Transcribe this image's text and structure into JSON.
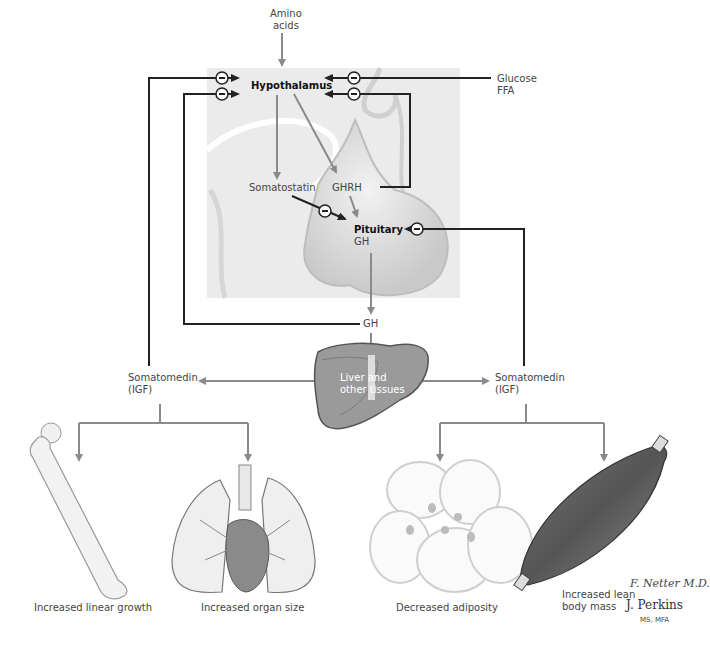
{
  "diagram": {
    "nodes": {
      "amino_acids": "Amino\nacids",
      "hypothalamus": "Hypothalamus",
      "glucose_ffa": "Glucose\nFFA",
      "somatostatin": "Somatostatin",
      "ghrh": "GHRH",
      "pituitary": "Pituitary",
      "pituitary_gh": "GH",
      "gh": "GH",
      "liver": "Liver and\nother tissues",
      "somatomedin_left": "Somatomedin\n(IGF)",
      "somatomedin_right": "Somatomedin\n(IGF)"
    },
    "effects": [
      {
        "label": "Increased linear growth",
        "illustration": "femur-bone"
      },
      {
        "label": "Increased organ size",
        "illustration": "heart-lungs"
      },
      {
        "label": "Decreased adiposity",
        "illustration": "fat-cells"
      },
      {
        "label": "Increased lean\nbody mass",
        "illustration": "muscle"
      }
    ],
    "inhibition_symbol": "−",
    "credits": {
      "signature": "F. Netter M.D.",
      "artist": "J. Perkins",
      "degree": "MS, MFA"
    },
    "colors": {
      "panel": "#ebebeb",
      "gray_arrow": "#8a8a8a",
      "black_arrow": "#222222",
      "gland": "#d4d4d4"
    }
  }
}
